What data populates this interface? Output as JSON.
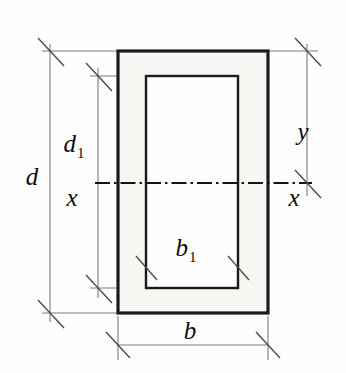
{
  "figure": {
    "type": "engineering-cross-section",
    "background_color": "#fefefe",
    "colors": {
      "outline": "#1a1a1a",
      "wall_fill": "#f7f6f3",
      "core_fill": "#fefefe",
      "dimension_line": "#7a7a7a",
      "dimension_tick": "#4a4a4a",
      "centerline": "#141414",
      "label_text": "#0d0d0d"
    }
  },
  "geometry": {
    "outer_rect": {
      "x": 118,
      "y": 51,
      "width": 150,
      "height": 262
    },
    "inner_rect": {
      "x": 146,
      "y": 76,
      "width": 92,
      "height": 212
    },
    "centerline": {
      "y": 183,
      "x_start": 95,
      "x_end": 312
    },
    "dim_d": {
      "x": 50,
      "y_top": 51,
      "y_bottom": 313
    },
    "dim_d1": {
      "x": 98,
      "y_top": 76,
      "y_bottom": 288
    },
    "dim_y": {
      "x": 307,
      "y_top": 51,
      "y_bottom": 183
    },
    "dim_b": {
      "y": 345,
      "x_left": 118,
      "x_right": 268
    },
    "dim_b1": {
      "y": 268,
      "x_left": 146,
      "x_right": 238
    }
  },
  "labels": {
    "overall_depth": {
      "text": "d",
      "x": 32,
      "y": 185
    },
    "inner_depth": {
      "base": "d",
      "sub": "1",
      "x": 74,
      "y": 152
    },
    "overall_width": {
      "text": "b",
      "x": 190,
      "y": 339
    },
    "inner_width": {
      "base": "b",
      "sub": "1",
      "x": 186,
      "y": 256
    },
    "axis_left": {
      "text": "x",
      "x": 72,
      "y": 206
    },
    "axis_right": {
      "text": "x",
      "x": 294,
      "y": 206
    },
    "centroid_distance": {
      "text": "y",
      "x": 303,
      "y": 140
    }
  }
}
